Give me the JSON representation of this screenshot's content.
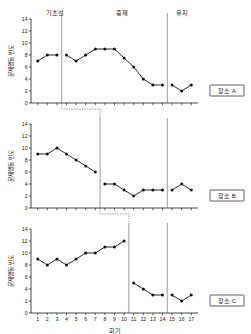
{
  "chart_data": {
    "type": "line",
    "title": "",
    "xlabel": "회기",
    "ylabel": "문제행동 빈도",
    "x": [
      1,
      2,
      3,
      4,
      5,
      6,
      7,
      8,
      9,
      10,
      11,
      12,
      13,
      14,
      15,
      16,
      17
    ],
    "xlim": [
      0.3,
      17.7
    ],
    "ylim": [
      0,
      14
    ],
    "yticks": [
      0,
      2,
      4,
      6,
      8,
      10,
      12,
      14
    ],
    "ytick_labels": [
      "0",
      "2",
      "4",
      "6",
      "8",
      "10",
      "12",
      "14"
    ],
    "xtick_labels": [
      "1",
      "2",
      "3",
      "4",
      "5",
      "6",
      "7",
      "8",
      "9",
      "10",
      "11",
      "12",
      "13",
      "14",
      "15",
      "16",
      "17"
    ],
    "grid": false,
    "legend_position": "right",
    "phase_labels": [
      "기초선",
      "중재",
      "유지"
    ],
    "panels": [
      {
        "name": "장소 A",
        "legend_label": "장소 A",
        "baseline_end_x": 3.5,
        "maintenance_start_x": 14.5,
        "segments": [
          {
            "phase": "기초선",
            "x": [
              1,
              2,
              3
            ],
            "values": [
              7,
              8,
              8
            ]
          },
          {
            "phase": "중재",
            "x": [
              4,
              5,
              6,
              7,
              8,
              9,
              10,
              11,
              12,
              13,
              14
            ],
            "values": [
              8,
              7,
              8,
              9,
              9,
              9,
              7.5,
              6,
              4,
              3,
              3
            ]
          },
          {
            "phase": "유지",
            "x": [
              15,
              16,
              17
            ],
            "values": [
              3,
              2,
              3
            ]
          }
        ]
      },
      {
        "name": "장소 B",
        "legend_label": "장소 B",
        "baseline_end_x": 7.5,
        "maintenance_start_x": 14.5,
        "segments": [
          {
            "phase": "기초선",
            "x": [
              1,
              2,
              3,
              4,
              5,
              6,
              7
            ],
            "values": [
              9,
              9,
              10,
              9,
              8,
              7,
              6
            ]
          },
          {
            "phase": "중재",
            "x": [
              8,
              9,
              10,
              11,
              12,
              13,
              14
            ],
            "values": [
              4,
              4,
              3,
              2,
              3,
              3,
              3
            ]
          },
          {
            "phase": "유지",
            "x": [
              15,
              16,
              17
            ],
            "values": [
              3,
              4,
              3
            ]
          }
        ]
      },
      {
        "name": "장소 C",
        "legend_label": "장소 C",
        "baseline_end_x": 10.5,
        "maintenance_start_x": 14.5,
        "segments": [
          {
            "phase": "기초선",
            "x": [
              1,
              2,
              3,
              4,
              5,
              6,
              7,
              8,
              9,
              10
            ],
            "values": [
              9,
              8,
              9,
              8,
              9,
              10,
              10,
              11,
              11,
              12
            ]
          },
          {
            "phase": "중재",
            "x": [
              11,
              12,
              13,
              14
            ],
            "values": [
              5,
              4,
              3,
              3
            ]
          },
          {
            "phase": "유지",
            "x": [
              15,
              16,
              17
            ],
            "values": [
              3,
              2,
              3
            ]
          }
        ]
      }
    ],
    "marker": "filled-circle",
    "line_color": "#111111",
    "axis_color": "#1a1a1a"
  }
}
